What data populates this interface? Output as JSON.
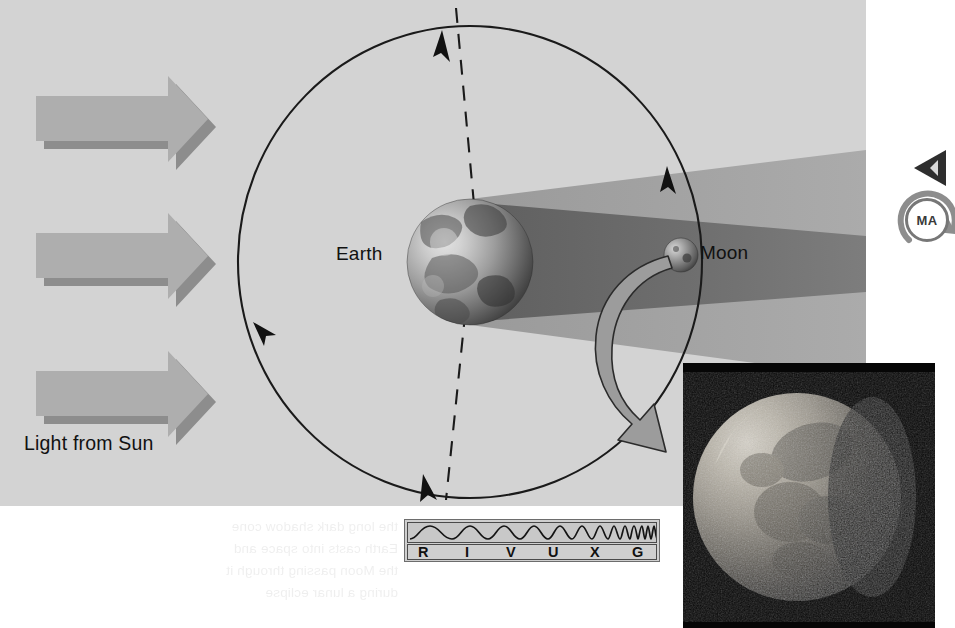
{
  "figure": {
    "panel_background": "#d3d3d3",
    "page_background": "#ffffff"
  },
  "labels": {
    "earth": "Earth",
    "moon": "Moon",
    "light_source": "Light from Sun"
  },
  "sun_arrows": {
    "count": 3,
    "direction": "right",
    "color": "#a8a8a8",
    "shadow_color": "#8f8f8f",
    "positions_y": [
      95,
      232,
      370
    ]
  },
  "orbit": {
    "description": "Moon orbit around Earth",
    "stroke": "#1a1a1a",
    "center_x": 470,
    "center_y": 262,
    "radius_x": 232,
    "radius_y": 236,
    "direction_arrowheads": 3
  },
  "node_line": {
    "description": "dashed line of nodes",
    "style": "dashed",
    "stroke": "#1a1a1a"
  },
  "earth": {
    "center_x": 470,
    "center_y": 262,
    "radius": 63,
    "lit_side": "left",
    "shadow_side": "right"
  },
  "moon": {
    "center_x": 681,
    "center_y": 255,
    "radius": 17,
    "state": "in Earth's shadow"
  },
  "shadow": {
    "umbra_color": "#6e6e6e",
    "penumbra_color": "#9a9a9a",
    "shape": "cone narrowing to the right"
  },
  "pointer_arrow": {
    "description": "curved arrow from Moon to inset photograph",
    "color": "#9a9a9a",
    "stroke": "#2b2b2b"
  },
  "spectrum_bar": {
    "letters": [
      "R",
      "I",
      "V",
      "U",
      "X",
      "G"
    ],
    "letter_meanings": [
      "Radio",
      "Infrared",
      "Visible",
      "Ultraviolet",
      "X-ray",
      "Gamma"
    ],
    "active_band": "V",
    "wave_description": "wavelength decreasing from left to right",
    "background": "#cfcfcf",
    "border": "#4a4a4a"
  },
  "inset_photo": {
    "subject": "Partially eclipsed Moon",
    "background": "#050505",
    "x": 683,
    "y": 363,
    "width": 252,
    "height": 265
  },
  "edge_marks": {
    "play_icon_label": "play-triangle",
    "badge_text": "MA"
  },
  "ghost_text": "the long dark shadow cone\nEarth casts into space and\nthe Moon passing through it\nduring a lunar eclipse"
}
